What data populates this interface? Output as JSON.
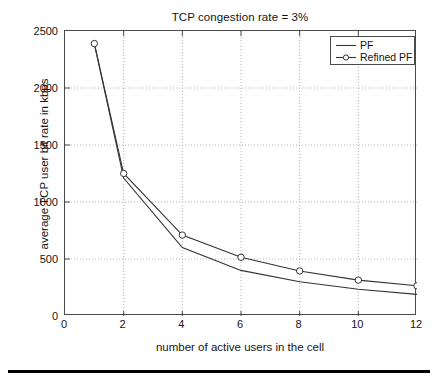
{
  "figure": {
    "bottom_rule": "horizontal-black-rule"
  },
  "chart_data": {
    "type": "line",
    "title": "TCP congestion rate = 3%",
    "xlabel": "number of active users in the cell",
    "ylabel": "average TCP user bit rate in kbps",
    "xlim": [
      0,
      12
    ],
    "ylim": [
      0,
      2500
    ],
    "xticks": [
      0,
      2,
      4,
      6,
      8,
      10,
      12
    ],
    "yticks": [
      0,
      500,
      1000,
      1500,
      2000,
      2500
    ],
    "xtick_labels": [
      "0",
      "2",
      "4",
      "6",
      "8",
      "10",
      "12"
    ],
    "ytick_labels": [
      "0",
      "500",
      "1000",
      "1500",
      "2000",
      "2500"
    ],
    "grid": true,
    "grid_style": "dotted",
    "grid_color": "#b4b4b4",
    "legend_position": "top-right",
    "line_color": "#333333",
    "x": [
      1,
      2,
      4,
      6,
      8,
      10,
      12
    ],
    "series": [
      {
        "name": "PF",
        "marker": "none",
        "values": [
          2390,
          1210,
          600,
          400,
          300,
          235,
          190
        ]
      },
      {
        "name": "Refined PF",
        "marker": "circle",
        "values": [
          2390,
          1250,
          710,
          515,
          395,
          315,
          265
        ]
      }
    ]
  },
  "legend": {
    "entries": [
      {
        "label": "PF",
        "marker": "line-sample"
      },
      {
        "label": "Refined PF",
        "marker": "line-circle-sample"
      }
    ]
  }
}
